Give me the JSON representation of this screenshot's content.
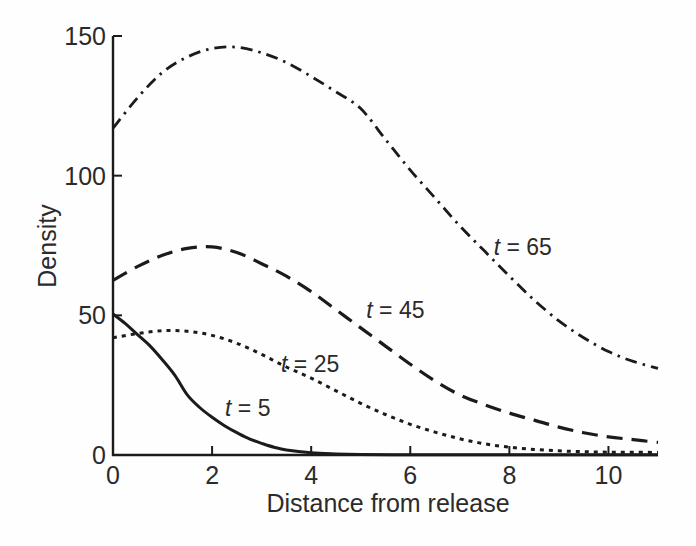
{
  "figure": {
    "background": "#fefefe",
    "ink_color": "#1b1b1b",
    "text_color": "#2b2b2b"
  },
  "chart_data": {
    "type": "line",
    "title": "",
    "xlabel": "Distance from release",
    "ylabel": "Density",
    "xlim": [
      0,
      11
    ],
    "ylim": [
      0,
      150
    ],
    "xticks": [
      0,
      2,
      4,
      6,
      8,
      10
    ],
    "yticks": [
      0,
      50,
      100,
      150
    ],
    "grid": false,
    "legend": "inline-curve-labels",
    "series": [
      {
        "name": "t = 5",
        "time": 5,
        "line_style": "solid",
        "x": [
          0,
          0.25,
          0.5,
          0.75,
          1,
          1.25,
          1.5,
          1.75,
          2,
          2.25,
          2.5,
          2.75,
          3,
          3.25,
          3.5,
          4,
          4.5,
          5,
          6,
          7,
          8,
          9,
          10,
          11
        ],
        "y": [
          50.5,
          47,
          43,
          39,
          34,
          28.5,
          21.5,
          17,
          13.5,
          10.5,
          8,
          5.8,
          4.2,
          2.8,
          1.8,
          0.8,
          0.4,
          0.2,
          0.1,
          0.1,
          0.1,
          0.1,
          0.1,
          0.1
        ],
        "label": {
          "prefix": "t",
          "rest": " = 5",
          "x": 2.72,
          "y": 17
        }
      },
      {
        "name": "t = 25",
        "time": 25,
        "line_style": "dotted",
        "x": [
          0,
          0.5,
          1,
          1.5,
          2,
          2.5,
          3,
          3.5,
          4,
          4.5,
          5,
          5.5,
          6,
          6.5,
          7,
          7.5,
          8,
          8.5,
          9,
          9.5,
          10,
          10.5,
          11
        ],
        "y": [
          42,
          43.5,
          44.5,
          44.3,
          42.8,
          40,
          36,
          31.5,
          27.5,
          23,
          18.5,
          14.5,
          11,
          8.2,
          5.8,
          4,
          2.8,
          2,
          1.5,
          1.2,
          1,
          1,
          0.9
        ],
        "label": {
          "prefix": "t",
          "rest": " = 25",
          "x": 3.98,
          "y": 32.5
        }
      },
      {
        "name": "t = 45",
        "time": 45,
        "line_style": "long-dash",
        "x": [
          0,
          0.5,
          1,
          1.5,
          2,
          2.5,
          3,
          3.5,
          4,
          4.5,
          5,
          5.5,
          6,
          6.5,
          7,
          7.5,
          8,
          8.5,
          9,
          9.5,
          10,
          10.5,
          11
        ],
        "y": [
          62.5,
          67.5,
          71.5,
          74,
          74.5,
          72.5,
          68.5,
          64,
          58.5,
          52,
          45.5,
          39,
          32.5,
          26.5,
          21.5,
          18,
          15,
          12.5,
          10,
          8,
          6.5,
          5.5,
          4.5
        ],
        "label": {
          "prefix": "t",
          "rest": " = 45",
          "x": 5.7,
          "y": 52
        }
      },
      {
        "name": "t = 65",
        "time": 65,
        "line_style": "dash-dot",
        "x": [
          0,
          0.5,
          1,
          1.5,
          2,
          2.5,
          3,
          3.5,
          4,
          4.5,
          5,
          5.5,
          6,
          6.5,
          7,
          7.5,
          8,
          8.5,
          9,
          9.5,
          10,
          10.5,
          11
        ],
        "y": [
          117,
          128,
          137,
          142.5,
          145.5,
          146,
          144,
          140.5,
          135.5,
          130,
          124,
          113,
          102,
          92,
          82,
          73,
          64,
          55.5,
          48,
          42,
          37,
          33.5,
          31
        ],
        "label": {
          "prefix": "t",
          "rest": " = 65",
          "x": 8.27,
          "y": 74.5
        }
      }
    ]
  }
}
